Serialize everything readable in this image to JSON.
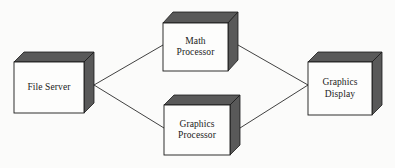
{
  "diagram": {
    "type": "block-diagram",
    "canvas": {
      "width": 395,
      "height": 168
    },
    "background_color": "#fbfbfa",
    "style": {
      "cube_front_color": "#fdfdfc",
      "cube_shade_color": "#595959",
      "cube_outline_color": "#1a1a1a",
      "connector_color": "#2b2b2b",
      "label_color": "#1a1a1a"
    },
    "nodes": [
      {
        "id": "file-server",
        "label_lines": [
          "File Server"
        ],
        "label": "File Server",
        "front": {
          "x": 14,
          "y": 62,
          "w": 70,
          "h": 51
        },
        "depth_x": 10,
        "depth_y": 10
      },
      {
        "id": "math-processor",
        "label_lines": [
          "Math",
          "Processor"
        ],
        "label": "Math Processor",
        "front": {
          "x": 163,
          "y": 23,
          "w": 65,
          "h": 48
        },
        "depth_x": 10,
        "depth_y": 11
      },
      {
        "id": "graphics-processor",
        "label_lines": [
          "Graphics",
          "Processor"
        ],
        "label": "Graphics Processor",
        "front": {
          "x": 164,
          "y": 105,
          "w": 66,
          "h": 50
        },
        "depth_x": 10,
        "depth_y": 10
      },
      {
        "id": "graphics-display",
        "label_lines": [
          "Graphics",
          "Display"
        ],
        "label": "Graphics Display",
        "front": {
          "x": 308,
          "y": 62,
          "w": 64,
          "h": 53
        },
        "depth_x": 10,
        "depth_y": 10
      }
    ],
    "connectors": [
      {
        "id": "file-server-to-math-processor",
        "from": "file-server",
        "to": "math-processor",
        "x1": 94,
        "y1": 85,
        "x2": 163,
        "y2": 45
      },
      {
        "id": "file-server-to-graphics-processor",
        "from": "file-server",
        "to": "graphics-processor",
        "x1": 94,
        "y1": 85,
        "x2": 164,
        "y2": 128
      },
      {
        "id": "math-processor-to-graphics-display",
        "from": "math-processor",
        "to": "graphics-display",
        "x1": 238,
        "y1": 45,
        "x2": 308,
        "y2": 85
      },
      {
        "id": "graphics-processor-to-graphics-display",
        "from": "graphics-processor",
        "to": "graphics-display",
        "x1": 240,
        "y1": 128,
        "x2": 308,
        "y2": 85
      }
    ]
  }
}
